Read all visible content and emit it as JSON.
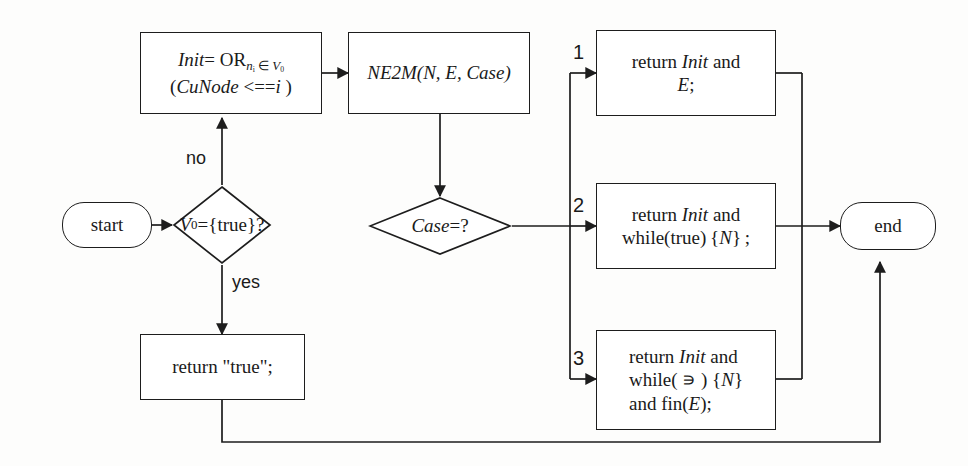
{
  "diagram": {
    "stroke_color": "#1d1d1d",
    "background_color": "#fdfdfc"
  },
  "nodes": {
    "start": {
      "label": "start",
      "shape": "terminator"
    },
    "end": {
      "label": "end",
      "shape": "terminator"
    },
    "init": {
      "shape": "process",
      "line1_a": "Init",
      "line1_b": "= OR",
      "line1_sub_n": "n",
      "line1_sub_sub_i": "i",
      "line1_sub_in": " ∈ ",
      "line1_sub_v": "V",
      "line1_sub_v_idx": "0",
      "line2_a": "(",
      "line2_b": "CuNode",
      "line2_c": " <==",
      "line2_d": "i",
      "line2_e": " )",
      "plain_text": "Init= OR nᵢ∈V₀ (CuNode <==i )"
    },
    "ne2m": {
      "shape": "process",
      "name": "NE2M",
      "args": "(N, E, Case)",
      "plain_text": "NE2M(N, E, Case)"
    },
    "decision_v0": {
      "shape": "decision",
      "var": "V",
      "var_sub": "0",
      "rest": "={true}?",
      "plain_text": "V₀={true}?"
    },
    "decision_case": {
      "shape": "decision",
      "var": "Case",
      "rest": "=?",
      "plain_text": "Case=?"
    },
    "return_true": {
      "shape": "process",
      "label": "return \"true\";"
    },
    "case1": {
      "shape": "process",
      "line1_a": "return ",
      "line1_b": "Init",
      "line1_c": " and",
      "line2_a": "E",
      "line2_b": ";",
      "plain_text": "return Init and E;"
    },
    "case2": {
      "shape": "process",
      "line1_a": "return ",
      "line1_b": "Init",
      "line1_c": " and",
      "line2_a": "while(true) {",
      "line2_b": "N",
      "line2_c": "} ;",
      "plain_text": "return Init and while(true){N};"
    },
    "case3": {
      "shape": "process",
      "line1_a": "return ",
      "line1_b": "Init",
      "line1_c": " and",
      "line2_a": "while( ∍ ) {",
      "line2_b": "N",
      "line2_c": "}",
      "line3_a": "and fin(",
      "line3_b": "E",
      "line3_c": ");",
      "plain_text": "return Init and while( ∍ ) {N} and fin(E);"
    }
  },
  "edge_labels": {
    "no": "no",
    "yes": "yes",
    "case_1": "1",
    "case_2": "2",
    "case_3": "3"
  }
}
